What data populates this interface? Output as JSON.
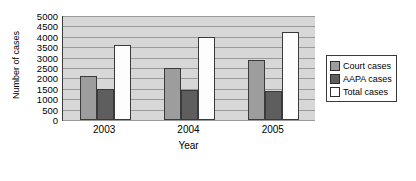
{
  "chart_data": {
    "type": "bar",
    "title": "",
    "xlabel": "Year",
    "ylabel": "Number of cases",
    "categories": [
      "2003",
      "2004",
      "2005"
    ],
    "series": [
      {
        "name": "Court cases",
        "values": [
          2100,
          2500,
          2900
        ],
        "color": "#9d9d9d"
      },
      {
        "name": "AAPA cases",
        "values": [
          1500,
          1450,
          1400
        ],
        "color": "#5e5e5e"
      },
      {
        "name": "Total cases",
        "values": [
          3600,
          4000,
          4250
        ],
        "color": "#ffffff"
      }
    ],
    "ylim": [
      0,
      5000
    ],
    "ytick_step": 500,
    "yticks": [
      "5000",
      "4500",
      "4000",
      "3500",
      "3000",
      "2500",
      "2000",
      "1500",
      "1000",
      "500",
      "0"
    ],
    "grid": true,
    "legend_position": "right",
    "plot_background": "#d7d7d7"
  }
}
